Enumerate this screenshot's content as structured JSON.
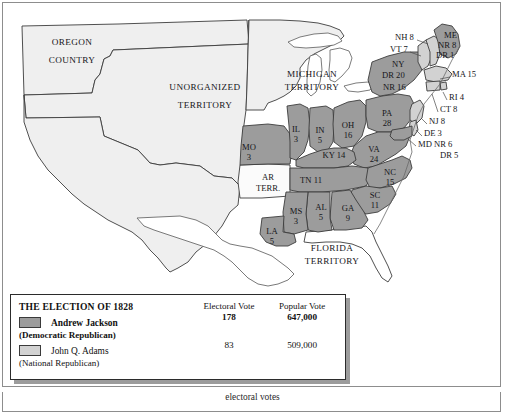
{
  "figure": {
    "kind": "historical-election-map",
    "caption_clipped": "electoral votes"
  },
  "legend": {
    "title": "THE ELECTION OF 1828",
    "columns": [
      "Electoral Vote",
      "Popular Vote"
    ],
    "rows": [
      {
        "swatch": "jackson-swatch",
        "color": "#9c9c9c",
        "candidate": "Andrew Jackson",
        "party": "(Democratic Republican)",
        "electoral": "178",
        "popular": "647,000",
        "bold": true
      },
      {
        "swatch": "adams-swatch",
        "color": "#d2d2d2",
        "candidate": "John Q. Adams",
        "party": "(National Republican)",
        "electoral": "83",
        "popular": "509,000",
        "bold": false
      }
    ]
  },
  "colors": {
    "jackson": "#9c9c9c",
    "adams": "#d2d2d2",
    "unshaded": "#efefef",
    "water": "#ffffff",
    "outline": "#3c3c3c",
    "text": "#16161a"
  },
  "territories": [
    {
      "name": "OREGON",
      "name2": "COUNTRY",
      "x": 72,
      "y": 43,
      "x2": 72,
      "y2": 61
    },
    {
      "name": "UNORGANIZED",
      "name2": "TERRITORY",
      "x": 205,
      "y": 88,
      "x2": 205,
      "y2": 106
    },
    {
      "name": "MICHIGAN",
      "name2": "TERRITORY",
      "x": 312,
      "y": 75,
      "x2": 312,
      "y2": 88
    },
    {
      "name": "FLORIDA",
      "name2": "TERRITORY",
      "x": 332,
      "y": 249,
      "x2": 332,
      "y2": 262
    }
  ],
  "states_inline": [
    {
      "abbr": "MO",
      "votes": "3",
      "x": 249,
      "y": 148,
      "party": "jackson"
    },
    {
      "abbr": "IL",
      "votes": "3",
      "x": 296,
      "y": 130,
      "party": "jackson"
    },
    {
      "abbr": "IN",
      "votes": "5",
      "x": 320,
      "y": 131,
      "party": "jackson"
    },
    {
      "abbr": "OH",
      "votes": "16",
      "x": 348,
      "y": 126,
      "party": "jackson"
    },
    {
      "abbr": "PA",
      "votes": "28",
      "x": 387,
      "y": 114,
      "party": "jackson"
    },
    {
      "abbr": "VA",
      "votes": "24",
      "x": 374,
      "y": 150,
      "party": "jackson"
    },
    {
      "abbr": "NC",
      "votes": "15",
      "x": 390,
      "y": 173,
      "party": "jackson"
    },
    {
      "abbr": "SC",
      "votes": "11",
      "x": 375,
      "y": 196,
      "party": "jackson"
    },
    {
      "abbr": "GA",
      "votes": "9",
      "x": 348,
      "y": 209,
      "party": "jackson"
    },
    {
      "abbr": "AL",
      "votes": "5",
      "x": 321,
      "y": 208,
      "party": "jackson"
    },
    {
      "abbr": "MS",
      "votes": "3",
      "x": 296,
      "y": 212,
      "party": "jackson"
    },
    {
      "abbr": "LA",
      "votes": "5",
      "x": 272,
      "y": 232,
      "party": "jackson"
    }
  ],
  "states_single_line": [
    {
      "text": "KY 14",
      "x": 334,
      "y": 156,
      "party": "jackson"
    },
    {
      "text": "TN 11",
      "x": 311,
      "y": 181,
      "party": "jackson"
    }
  ],
  "states_two_word": [
    {
      "line1": "AR",
      "line2": "TERR.",
      "x": 268,
      "y": 178,
      "x2": 268,
      "y2": 189,
      "party": "none"
    }
  ],
  "leader_labels": [
    {
      "text": "NH 8",
      "x": 395,
      "y": 38,
      "align": "start"
    },
    {
      "text": "VT 7",
      "x": 390,
      "y": 50,
      "align": "start"
    },
    {
      "text": "ME",
      "x": 444,
      "y": 36,
      "align": "start"
    },
    {
      "text": "NR 8",
      "x": 438,
      "y": 46,
      "align": "start"
    },
    {
      "text": "DR 1",
      "x": 436,
      "y": 56,
      "align": "start"
    },
    {
      "text": "MA 15",
      "x": 452,
      "y": 75,
      "align": "start"
    },
    {
      "text": "NY",
      "x": 392,
      "y": 65,
      "align": "start"
    },
    {
      "text": "DR 20",
      "x": 382,
      "y": 76,
      "align": "start"
    },
    {
      "text": "NR 16",
      "x": 383,
      "y": 88,
      "align": "start"
    },
    {
      "text": "RI 4",
      "x": 449,
      "y": 98,
      "align": "start"
    },
    {
      "text": "CT 8",
      "x": 440,
      "y": 110,
      "align": "start"
    },
    {
      "text": "NJ 8",
      "x": 429,
      "y": 122,
      "align": "start"
    },
    {
      "text": "DE 3",
      "x": 424,
      "y": 134,
      "align": "start"
    },
    {
      "text": "MD NR 6",
      "x": 418,
      "y": 145,
      "align": "start"
    },
    {
      "text": "DR 5",
      "x": 440,
      "y": 156,
      "align": "start"
    }
  ],
  "chart_data": {
    "type": "map",
    "title": "THE ELECTION OF 1828",
    "candidates": [
      {
        "name": "Andrew Jackson",
        "party": "Democratic Republican",
        "electoral_vote": 178,
        "popular_vote": 647000,
        "color": "#9c9c9c"
      },
      {
        "name": "John Q. Adams",
        "party": "National Republican",
        "electoral_vote": 83,
        "popular_vote": 509000,
        "color": "#d2d2d2"
      }
    ],
    "state_results": [
      {
        "state": "MO",
        "electoral": 3,
        "winner": "Jackson"
      },
      {
        "state": "IL",
        "electoral": 3,
        "winner": "Jackson"
      },
      {
        "state": "IN",
        "electoral": 5,
        "winner": "Jackson"
      },
      {
        "state": "OH",
        "electoral": 16,
        "winner": "Jackson"
      },
      {
        "state": "PA",
        "electoral": 28,
        "winner": "Jackson"
      },
      {
        "state": "VA",
        "electoral": 24,
        "winner": "Jackson"
      },
      {
        "state": "NC",
        "electoral": 15,
        "winner": "Jackson"
      },
      {
        "state": "SC",
        "electoral": 11,
        "winner": "Jackson"
      },
      {
        "state": "GA",
        "electoral": 9,
        "winner": "Jackson"
      },
      {
        "state": "AL",
        "electoral": 5,
        "winner": "Jackson"
      },
      {
        "state": "MS",
        "electoral": 3,
        "winner": "Jackson"
      },
      {
        "state": "LA",
        "electoral": 5,
        "winner": "Jackson"
      },
      {
        "state": "KY",
        "electoral": 14,
        "winner": "Jackson"
      },
      {
        "state": "TN",
        "electoral": 11,
        "winner": "Jackson"
      },
      {
        "state": "ME",
        "electoral": 9,
        "split": {
          "NR": 8,
          "DR": 1
        }
      },
      {
        "state": "NY",
        "electoral": 36,
        "split": {
          "DR": 20,
          "NR": 16
        }
      },
      {
        "state": "MD",
        "electoral": 11,
        "split": {
          "NR": 6,
          "DR": 5
        }
      },
      {
        "state": "NH",
        "electoral": 8,
        "winner": "Adams"
      },
      {
        "state": "VT",
        "electoral": 7,
        "winner": "Adams"
      },
      {
        "state": "MA",
        "electoral": 15,
        "winner": "Adams"
      },
      {
        "state": "RI",
        "electoral": 4,
        "winner": "Adams"
      },
      {
        "state": "CT",
        "electoral": 8,
        "winner": "Adams"
      },
      {
        "state": "NJ",
        "electoral": 8,
        "winner": "Adams"
      },
      {
        "state": "DE",
        "electoral": 3,
        "winner": "Adams"
      }
    ],
    "territories": [
      "Oregon Country",
      "Unorganized Territory",
      "Michigan Territory",
      "Florida Territory",
      "Arkansas Territory"
    ]
  }
}
